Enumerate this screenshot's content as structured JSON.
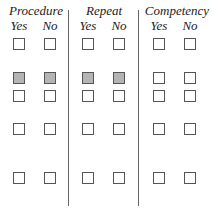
{
  "groups": [
    {
      "title": "Procedure",
      "yes": "Yes",
      "no": "No"
    },
    {
      "title": "Repeat",
      "yes": "Yes",
      "no": "No"
    },
    {
      "title": "Competency",
      "yes": "Yes",
      "no": "No"
    }
  ],
  "rows": [
    {
      "filled": [
        false,
        false,
        false,
        false,
        false,
        false
      ]
    },
    {
      "filled": [
        true,
        true,
        true,
        true,
        false,
        false
      ]
    },
    {
      "filled": [
        false,
        false,
        false,
        false,
        false,
        false
      ]
    },
    {
      "filled": [
        false,
        false,
        false,
        false,
        false,
        false
      ]
    },
    {
      "filled": [
        false,
        false,
        false,
        false,
        false,
        false
      ]
    }
  ],
  "colors": {
    "filled_box": "#b4b4b4",
    "border": "#555555",
    "divider": "#666666"
  }
}
